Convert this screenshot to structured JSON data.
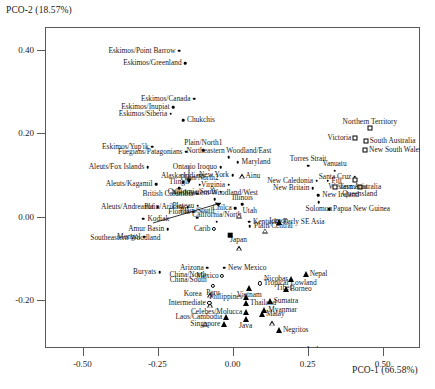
{
  "chart_data": {
    "type": "scatter",
    "title": "",
    "xlabel": "PCO-1 (66.58%)",
    "ylabel": "PCO-2 (18.57%)",
    "xlim": [
      -0.625,
      0.625
    ],
    "ylim": [
      -0.315,
      0.455
    ],
    "xticks": [
      -0.5,
      -0.25,
      0.0,
      0.25,
      0.5
    ],
    "xticklabels": [
      "-0.50",
      "-0.25",
      "0.00",
      "0.25",
      "0.50"
    ],
    "yticks": [
      0.4,
      0.2,
      0.0,
      -0.2
    ],
    "yticklabels": [
      "0.40",
      "0.20",
      "0.00",
      "-0.20"
    ],
    "grid": false,
    "legend": null,
    "series": [
      {
        "name": "filled-dot",
        "marker": "m-dot",
        "points": [
          {
            "label": "Eskimos/Point Barrow",
            "x": -0.178,
            "y": 0.398,
            "side": "r"
          },
          {
            "label": "Eskimos/Greenland",
            "x": -0.158,
            "y": 0.368,
            "side": "r"
          },
          {
            "label": "Eskimos/Canada",
            "x": -0.128,
            "y": 0.283,
            "side": "r"
          },
          {
            "label": "Eskimos/Inupiat",
            "x": -0.198,
            "y": 0.262,
            "side": "r"
          },
          {
            "label": "Eskimos/Siberia",
            "x": -0.206,
            "y": 0.247,
            "side": "r"
          },
          {
            "label": "Chukchis",
            "x": -0.165,
            "y": 0.232,
            "side": "l"
          },
          {
            "label": "Eskimos/Yup'ik",
            "x": -0.268,
            "y": 0.168,
            "side": "r"
          },
          {
            "label": "Fuegians/Patagonians",
            "x": -0.155,
            "y": 0.156,
            "side": "r"
          },
          {
            "label": "Plain/North1",
            "x": -0.097,
            "y": 0.16,
            "side": "c-top"
          },
          {
            "label": "Northeastern Woodland/East",
            "x": -0.012,
            "y": 0.142,
            "side": "c-top"
          },
          {
            "label": "Aleuts/Fox Islands",
            "x": -0.282,
            "y": 0.118,
            "side": "r"
          },
          {
            "label": "Ontario Iroquo",
            "x": -0.04,
            "y": 0.118,
            "side": "r"
          },
          {
            "label": "Maryland",
            "x": 0.017,
            "y": 0.13,
            "side": "l"
          },
          {
            "label": "New York",
            "x": 0.0,
            "y": 0.1,
            "side": "r"
          },
          {
            "label": "Aleuts/Kagamil",
            "x": -0.255,
            "y": 0.078,
            "side": "r"
          },
          {
            "label": "Alaska Indians",
            "x": -0.165,
            "y": 0.082,
            "side": "c-top"
          },
          {
            "label": "Tlingit",
            "x": -0.178,
            "y": 0.068,
            "side": "c-top"
          },
          {
            "label": "Plain/North2",
            "x": -0.11,
            "y": 0.077,
            "side": "c-top"
          },
          {
            "label": "Virginia",
            "x": -0.013,
            "y": 0.077,
            "side": "r"
          },
          {
            "label": "British Columbia",
            "x": -0.118,
            "y": 0.055,
            "side": "r"
          },
          {
            "label": "California/South",
            "x": -0.04,
            "y": 0.06,
            "side": "r"
          },
          {
            "label": "Northeastern Woodland/West",
            "x": -0.06,
            "y": 0.042,
            "side": "c-top"
          },
          {
            "label": "Aleuts/Andreanof",
            "x": -0.25,
            "y": 0.023,
            "side": "r"
          },
          {
            "label": "Plain/Arikara",
            "x": -0.15,
            "y": 0.023,
            "side": "r"
          },
          {
            "label": "Plateau",
            "x": -0.116,
            "y": 0.026,
            "side": "r"
          },
          {
            "label": "Florida",
            "x": -0.131,
            "y": 0.012,
            "side": "r"
          },
          {
            "label": "Plain/South",
            "x": -0.118,
            "y": -0.002,
            "side": "c-top"
          },
          {
            "label": "Kodiak",
            "x": -0.297,
            "y": -0.005,
            "side": "l"
          },
          {
            "label": "California/North",
            "x": -0.052,
            "y": -0.012,
            "side": "c-top"
          },
          {
            "label": "Illinois",
            "x": 0.033,
            "y": 0.03,
            "side": "c-top"
          },
          {
            "label": "Chilca",
            "x": 0.009,
            "y": 0.02,
            "side": "r"
          },
          {
            "label": "Kentucky",
            "x": 0.055,
            "y": -0.012,
            "side": "l"
          },
          {
            "label": "Plain/Central",
            "x": 0.058,
            "y": -0.023,
            "side": "l"
          },
          {
            "label": "Amur Basin",
            "x": -0.216,
            "y": -0.03,
            "side": "r"
          },
          {
            "label": "Mongol",
            "x": -0.295,
            "y": -0.048,
            "side": "r"
          },
          {
            "label": "Buryats",
            "x": -0.243,
            "y": -0.133,
            "side": "r"
          },
          {
            "label": "Arizona",
            "x": -0.084,
            "y": -0.122,
            "side": "r"
          },
          {
            "label": "New Mexico",
            "x": -0.028,
            "y": -0.122,
            "side": "l"
          },
          {
            "label": "Torres Strait",
            "x": 0.252,
            "y": 0.122,
            "side": "c-top"
          },
          {
            "label": "Vanuatu",
            "x": 0.34,
            "y": 0.11,
            "side": "c-top"
          },
          {
            "label": "Santa Cruz",
            "x": 0.408,
            "y": 0.095,
            "side": "r"
          },
          {
            "label": "Fiji",
            "x": 0.317,
            "y": 0.086,
            "side": "l"
          },
          {
            "label": "New Caledonia",
            "x": 0.28,
            "y": 0.086,
            "side": "r"
          },
          {
            "label": "New Britain",
            "x": 0.268,
            "y": 0.068,
            "side": "r"
          },
          {
            "label": "New Ireland",
            "x": 0.286,
            "y": 0.052,
            "side": "l"
          },
          {
            "label": "Solomon",
            "x": 0.288,
            "y": 0.035,
            "side": "c-bot"
          },
          {
            "label": "Papua New Guinea",
            "x": 0.322,
            "y": 0.018,
            "side": "l"
          }
        ]
      },
      {
        "name": "open-square",
        "marker": "m-osq",
        "points": [
          {
            "label": "Northern Territory",
            "x": 0.458,
            "y": 0.212,
            "side": "c-top"
          },
          {
            "label": "Victoria",
            "x": 0.408,
            "y": 0.188,
            "side": "r"
          },
          {
            "label": "South Australia",
            "x": 0.444,
            "y": 0.182,
            "side": "l"
          },
          {
            "label": "New South Wales",
            "x": 0.442,
            "y": 0.16,
            "side": "l"
          },
          {
            "label": "Western Australia",
            "x": 0.408,
            "y": 0.089,
            "side": "c-bot"
          },
          {
            "label": "Queensland",
            "x": 0.424,
            "y": 0.072,
            "side": "c-bot"
          },
          {
            "label": "Tasmania",
            "x": 0.342,
            "y": 0.072,
            "side": "l"
          }
        ]
      },
      {
        "name": "open-triangle",
        "marker": "m-otri",
        "points": [
          {
            "label": "Ainu",
            "x": 0.03,
            "y": 0.097,
            "side": "l"
          },
          {
            "label": "Utah",
            "x": 0.02,
            "y": 0.014,
            "side": "l"
          },
          {
            "label": "Jomon",
            "x": 0.107,
            "y": -0.01,
            "side": "l"
          },
          {
            "label": "Japan",
            "x": 0.02,
            "y": -0.04,
            "side": "c-bot"
          },
          {
            "label": "China/North",
            "x": -0.075,
            "y": -0.14,
            "side": "r"
          },
          {
            "label": "China/South",
            "x": -0.074,
            "y": -0.152,
            "side": "r"
          },
          {
            "label": "Korea",
            "x": -0.091,
            "y": -0.185,
            "side": "r"
          },
          {
            "label": "Tibet",
            "x": 0.132,
            "y": -0.172,
            "side": "l"
          }
        ]
      },
      {
        "name": "open-circle",
        "marker": "m-ocirc",
        "points": [
          {
            "label": "Carib",
            "x": -0.062,
            "y": -0.03,
            "side": "r"
          },
          {
            "label": "Mexico",
            "x": -0.034,
            "y": -0.143,
            "side": "r"
          },
          {
            "label": "Peru",
            "x": -0.065,
            "y": -0.166,
            "side": "c-bot"
          },
          {
            "label": "Tropical Lowland",
            "x": 0.091,
            "y": -0.16,
            "side": "l"
          },
          {
            "label": "Intermediate",
            "x": -0.077,
            "y": -0.207,
            "side": "r"
          }
        ]
      },
      {
        "name": "filled-triangle",
        "marker": "m-ftri",
        "points": [
          {
            "label": "Early SE Asia",
            "x": 0.155,
            "y": -0.012,
            "side": "l"
          },
          {
            "label": "Vietnam",
            "x": 0.056,
            "y": -0.172,
            "side": "c-bot"
          },
          {
            "label": "Borneo",
            "x": 0.178,
            "y": -0.174,
            "side": "l"
          },
          {
            "label": "Nicobar",
            "x": 0.196,
            "y": -0.15,
            "side": "r"
          },
          {
            "label": "Nepal",
            "x": 0.244,
            "y": -0.138,
            "side": "l"
          },
          {
            "label": "Philippines",
            "x": 0.045,
            "y": -0.192,
            "side": "r"
          },
          {
            "label": "Sumatra",
            "x": 0.124,
            "y": -0.202,
            "side": "l"
          },
          {
            "label": "Thailand",
            "x": 0.045,
            "y": -0.208,
            "side": "l"
          },
          {
            "label": "Myanmar",
            "x": 0.106,
            "y": -0.224,
            "side": "l"
          },
          {
            "label": "Malay",
            "x": 0.098,
            "y": -0.234,
            "side": "l"
          },
          {
            "label": "Celebes/Molucca",
            "x": 0.044,
            "y": -0.229,
            "side": "r"
          },
          {
            "label": "Java",
            "x": 0.044,
            "y": -0.245,
            "side": "c-bot"
          },
          {
            "label": "Laos/Cambodia",
            "x": -0.022,
            "y": -0.24,
            "side": "r"
          },
          {
            "label": "Singapore",
            "x": -0.029,
            "y": -0.258,
            "side": "r"
          },
          {
            "label": "Negritos",
            "x": 0.155,
            "y": -0.272,
            "side": "l"
          },
          {
            "label": "Andaman",
            "x": 0.23,
            "y": -0.32,
            "side": "l"
          }
        ]
      },
      {
        "name": "filled-square",
        "marker": "m-fsq",
        "points": [
          {
            "label": "Southeastern Woodland",
            "x": -0.007,
            "y": -0.044,
            "side": "leader"
          }
        ]
      }
    ],
    "annotations": [
      {
        "kind": "arrow",
        "text": "Southeastern Woodland",
        "x": -0.12,
        "y": -0.044
      },
      {
        "kind": "arrow",
        "text": "Plateau-pointer",
        "x": -0.088,
        "y": 0.028
      }
    ]
  }
}
